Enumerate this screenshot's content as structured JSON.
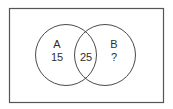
{
  "diagram": {
    "type": "venn",
    "universe": {
      "label": ""
    },
    "sets": [
      {
        "name": "A",
        "label": "A",
        "only_value": "15"
      },
      {
        "name": "B",
        "label": "B",
        "only_value": "?"
      }
    ],
    "intersection": {
      "sets": [
        "A",
        "B"
      ],
      "value": "25"
    },
    "colors": {
      "stroke": "#4a4a4a",
      "text": "#2e2e2e",
      "background": "#ffffff"
    }
  }
}
